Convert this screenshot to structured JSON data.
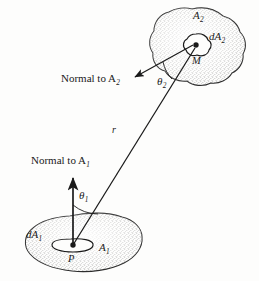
{
  "figure": {
    "background_color": "#fdfdfc",
    "ink_color": "#1a1a1a"
  },
  "labels": {
    "area_upper": "A",
    "area_upper_sub": "2",
    "area_lower": "A",
    "area_lower_sub": "1",
    "diff_area_upper": "dA",
    "diff_area_upper_sub": "2",
    "diff_area_lower": "dA",
    "diff_area_lower_sub": "1",
    "point_upper": "M",
    "point_lower": "P",
    "normal_upper": "Normal to A",
    "normal_upper_sub": "2",
    "normal_lower": "Normal to A",
    "normal_lower_sub": "1",
    "theta_upper": "θ",
    "theta_upper_sub": "2",
    "theta_lower": "θ",
    "theta_lower_sub": "1",
    "distance": "r"
  },
  "icons": {
    "upper_surface": "blob-shape-icon",
    "lower_surface": "blob-shape-icon",
    "upper_element": "small-blob-icon",
    "lower_element": "small-ellipse-icon",
    "normal_upper_arrow": "arrow-icon",
    "normal_lower_arrow": "arrow-icon",
    "ray": "line-icon",
    "theta_upper_arc": "arc-icon",
    "theta_lower_arc": "arc-icon",
    "point_marker_upper": "dot-icon",
    "point_marker_lower": "dot-icon"
  },
  "geometry": {
    "point_M": [
      196,
      47
    ],
    "point_P": [
      72,
      246
    ],
    "ray_label_position": [
      113,
      128
    ],
    "normal_upper_tip": [
      133,
      78
    ],
    "normal_lower_tip": [
      74,
      180
    ]
  }
}
